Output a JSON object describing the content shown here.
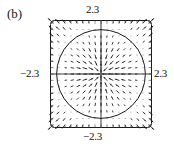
{
  "figure": {
    "panel_label": "(b)",
    "type": "vector-field-phase-portrait"
  },
  "axis_labels": {
    "top": "2.3",
    "bottom": "−2.3",
    "left": "−2.3",
    "right": "2.3"
  },
  "chart_data": {
    "type": "scatter",
    "title": "(b)",
    "xlabel": "",
    "ylabel": "",
    "xlim": [
      -2.3,
      2.3
    ],
    "ylim": [
      -2.3,
      2.3
    ],
    "grid": false,
    "legend": null,
    "xticklabels": [
      "−2.3",
      "2.3"
    ],
    "yticklabels": [
      "−2.3",
      "2.3"
    ],
    "annotations": [
      {
        "text": "(b)",
        "position": "outside-top-left"
      },
      {
        "text": "2.3",
        "position": "top-center"
      },
      {
        "text": "−2.3",
        "position": "bottom-center"
      },
      {
        "text": "−2.3",
        "position": "left-middle"
      },
      {
        "text": "2.3",
        "position": "right-middle"
      }
    ],
    "overlays": [
      {
        "kind": "circle",
        "center": [
          0,
          0
        ],
        "radius": 2.0,
        "stroke": "#1a1a1a",
        "fill": "none",
        "description": "limit cycle"
      },
      {
        "kind": "axis-line",
        "orientation": "horizontal",
        "value": 0
      },
      {
        "kind": "axis-line",
        "orientation": "vertical",
        "value": 0
      }
    ],
    "vector_field": {
      "description": "Radial direction field on a 17x17 grid over [-2.3,2.3]^2. Arrow length grows with distance from the invariant circle r=2: near r=0 and near r=2 the arrows shrink to dots; outside the circle arrows point radially outward and are longest at the corners.",
      "grid_n": 17,
      "x_min": -2.3,
      "x_max": 2.3,
      "y_min": -2.3,
      "y_max": 2.3,
      "limit_cycle_radius": 2.0,
      "arrow_color": "#1a1a1a",
      "magnitude_rule": "abs(r*r - 4) * 0.055",
      "direction_rule": "sign(r*r - 4) * radial_unit_vector"
    },
    "box": {
      "stroke": "#1a1a1a",
      "corner_radius": 4,
      "left_px": 50,
      "top_px": 20,
      "width_px": 102,
      "height_px": 108
    },
    "ticks": {
      "count_per_side": 17,
      "length_px": 2.5,
      "stroke": "#333333"
    }
  },
  "colors": {
    "ink": "#1a1a1a",
    "background": "#ffffff",
    "axis": "#3a3a3a"
  }
}
